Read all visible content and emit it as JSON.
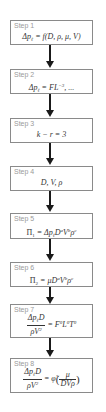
{
  "diagram": {
    "type": "flowchart",
    "direction": "top-to-bottom",
    "colors": {
      "box_border": "#8a8a8a",
      "step_label": "#9a9a9a",
      "formula_text": "#333333",
      "arrow": "#1a1a1a"
    },
    "steps": [
      {
        "label": "Step 1",
        "formula_text": "Δpℓ = f(D, ρ, μ, V)",
        "parts": {
          "lhs": "Δp",
          "sub": "ℓ",
          "rhs": " = f(D, ρ, μ, V)"
        }
      },
      {
        "label": "Step 2",
        "formula_text": "Δpℓ = FL⁻³, ...",
        "parts": {
          "lhs": "Δp",
          "sub": "ℓ",
          "mid": " = FL",
          "sup": "−3",
          "tail": ", ..."
        }
      },
      {
        "label": "Step 3",
        "formula_text": "k − r = 3",
        "parts": {
          "expr": "k − r = 3"
        }
      },
      {
        "label": "Step 4",
        "formula_text": "D, V, ρ",
        "parts": {
          "expr": "D, V, ρ"
        }
      },
      {
        "label": "Step 5",
        "formula_text": "Π₁ = Δpℓ D^a V^b ρ^c",
        "parts": {
          "pi": "Π",
          "pi_sub": "1",
          "eq": " = Δp",
          "sub": "ℓ",
          "d": "D",
          "a": "a",
          "v": "V",
          "b": "b",
          "rho": "ρ",
          "c": "c"
        }
      },
      {
        "label": "Step 6",
        "formula_text": "Π₂ = μ D^a V^b ρ^c",
        "parts": {
          "pi": "Π",
          "pi_sub": "2",
          "eq": " = μD",
          "a": "a",
          "v": "V",
          "b": "b",
          "rho": "ρ",
          "c": "c"
        }
      },
      {
        "label": "Step 7",
        "formula_text": "Δpℓ D / ρV² = F⁰L⁰T⁰",
        "parts": {
          "num": "Δp",
          "num_sub": "ℓ",
          "num_tail": "D",
          "den": "ρV",
          "den_sup": "2",
          "eq": " = F",
          "s1": "0",
          "l": "L",
          "s2": "0",
          "t": "T",
          "s3": "0"
        }
      },
      {
        "label": "Step 8",
        "formula_text": "Δpℓ D / ρV² = φ̃(μ / DVρ)",
        "parts": {
          "num": "Δp",
          "num_sub": "ℓ",
          "num_tail": "D",
          "den": "ρV",
          "den_sup": "2",
          "eq": " = ",
          "phi": "φ̃",
          "lp": "(",
          "inner_num": "μ",
          "inner_den": "DVρ",
          "rp": ")"
        }
      }
    ]
  }
}
